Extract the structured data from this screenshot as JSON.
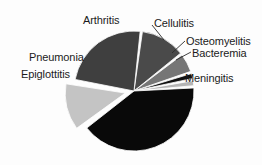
{
  "chart_data": {
    "type": "pie",
    "title": "",
    "subtitle": "",
    "xlabel": "",
    "ylabel": "",
    "legend_position": "none",
    "grid": false,
    "labels_position": "outside-callout",
    "start_angle_deg": -83,
    "direction": "clockwise",
    "categories": [
      "Arthritis",
      "Cellulitis",
      "Osteomyelitis",
      "Bacteremia",
      "Meningitis",
      "Epiglottitis",
      "Pneumonia"
    ],
    "values": [
      12.5,
      5.5,
      2.0,
      2.0,
      41.0,
      13.0,
      24.0
    ],
    "units": "percent",
    "colors": [
      "#4a4a4a",
      "#767676",
      "#111111",
      "#b4b4b4",
      "#090909",
      "#c4c4c4",
      "#3f3f3f"
    ],
    "exploded": [
      false,
      false,
      false,
      false,
      false,
      true,
      false
    ],
    "slices": [
      {
        "name": "Arthritis",
        "value": 12.5,
        "color": "#4a4a4a",
        "start_angle_deg": -83,
        "end_angle_deg": -38,
        "exploded": false
      },
      {
        "name": "Cellulitis",
        "value": 5.5,
        "color": "#767676",
        "start_angle_deg": -38,
        "end_angle_deg": -18,
        "exploded": false
      },
      {
        "name": "Osteomyelitis",
        "value": 2.0,
        "color": "#111111",
        "start_angle_deg": -18,
        "end_angle_deg": -11,
        "exploded": false
      },
      {
        "name": "Bacteremia",
        "value": 2.0,
        "color": "#b4b4b4",
        "start_angle_deg": -11,
        "end_angle_deg": -4,
        "exploded": false
      },
      {
        "name": "Meningitis",
        "value": 41.0,
        "color": "#090909",
        "start_angle_deg": -4,
        "end_angle_deg": 143,
        "exploded": false
      },
      {
        "name": "Epiglottitis",
        "value": 13.0,
        "color": "#c4c4c4",
        "start_angle_deg": 143,
        "end_angle_deg": 190,
        "exploded": true
      },
      {
        "name": "Pneumonia",
        "value": 24.0,
        "color": "#3f3f3f",
        "start_angle_deg": 190,
        "end_angle_deg": 277,
        "exploded": false
      }
    ],
    "geometry": {
      "center_x": 134,
      "center_y": 91,
      "radius": 60,
      "explode_offset": 9,
      "slice_gap_deg": 2.2
    }
  },
  "labels": {
    "arthritis": "Arthritis",
    "cellulitis": "Cellulitis",
    "osteomyelitis": "Osteomyelitis",
    "bacteremia": "Bacteremia",
    "pneumonia": "Pneumonia",
    "epiglottitis": "Epiglottitis",
    "meningitis": "Meningitis"
  }
}
